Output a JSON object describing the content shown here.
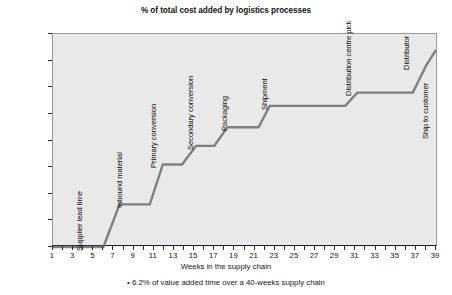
{
  "chart_data": {
    "type": "line",
    "title": "% of total cost added by logistics processes",
    "xlabel": "Weeks in the supply chain",
    "ylabel": "",
    "xlim": [
      1,
      39
    ],
    "ylim": [
      0,
      80
    ],
    "grid": false,
    "legend": "none",
    "caption": "• 6.2% of value added time over a 40-weeks supply chain",
    "y_ticks": [
      "0%",
      "10%",
      "20%",
      "30%",
      "40%",
      "50%",
      "60%",
      "70%",
      "80%"
    ],
    "y_tick_values": [
      0,
      10,
      20,
      30,
      40,
      50,
      60,
      70,
      80
    ],
    "x_ticks": [
      1,
      2,
      3,
      4,
      5,
      6,
      7,
      8,
      9,
      10,
      11,
      12,
      13,
      14,
      15,
      16,
      17,
      18,
      19,
      20,
      21,
      22,
      23,
      24,
      25,
      26,
      27,
      28,
      29,
      30,
      31,
      32,
      33,
      34,
      35,
      36,
      37,
      38,
      39,
      40
    ],
    "x_tick_labels": [
      1,
      3,
      5,
      7,
      9,
      11,
      13,
      15,
      17,
      19,
      21,
      23,
      25,
      27,
      29,
      31,
      33,
      35,
      37,
      39
    ],
    "series": [
      {
        "name": "Cumulative % of total cost added",
        "x": [
          1,
          6,
          7.6,
          10.6,
          11.9,
          13.8,
          15.2,
          17.0,
          18.3,
          21.4,
          22.5,
          30.0,
          31.2,
          36.7,
          38.0,
          39.0
        ],
        "values": [
          0,
          0,
          16,
          16,
          31,
          31,
          38,
          38,
          45,
          45,
          53,
          53,
          58,
          58,
          68,
          74
        ]
      }
    ],
    "steps": [
      {
        "process": "Supplier lead time",
        "start_week": 1,
        "end_week": 6,
        "level": 0
      },
      {
        "process": "Inbound material",
        "start_week": 7.6,
        "end_week": 10.6,
        "level": 16
      },
      {
        "process": "Primary conversion",
        "start_week": 11.9,
        "end_week": 13.8,
        "level": 31
      },
      {
        "process": "Secondary conversion",
        "start_week": 15.2,
        "end_week": 17.0,
        "level": 38
      },
      {
        "process": "Packaging",
        "start_week": 18.3,
        "end_week": 21.4,
        "level": 45
      },
      {
        "process": "Shipment",
        "start_week": 22.5,
        "end_week": 30.0,
        "level": 53
      },
      {
        "process": "Distribution centre pick",
        "start_week": 31.2,
        "end_week": 36.7,
        "level": 58
      },
      {
        "process": "Distributor",
        "start_week": 38.0,
        "end_week": 38.4,
        "level": 68
      },
      {
        "process": "Ship to customer",
        "start_week": 39.0,
        "end_week": 39.0,
        "level": 74
      }
    ],
    "process_labels": [
      {
        "label": "Supplier lead time",
        "week": 4.1,
        "base_pct": 2
      },
      {
        "label": "Inbound material",
        "week": 8.0,
        "base_pct": 18
      },
      {
        "label": "Primary conversion",
        "week": 11.4,
        "base_pct": 33
      },
      {
        "label": "Secondary conversion",
        "week": 15.1,
        "base_pct": 40
      },
      {
        "label": "Packaging",
        "week": 18.5,
        "base_pct": 47
      },
      {
        "label": "Shipment",
        "week": 22.4,
        "base_pct": 55
      },
      {
        "label": "Distribution centre pick",
        "week": 30.8,
        "base_pct": 60
      },
      {
        "label": "Distributor",
        "week": 36.5,
        "base_pct": 70
      },
      {
        "label": "Ship to customer",
        "week": 38.4,
        "base_pct": 44
      }
    ],
    "colors": {
      "plot_background": "#e9e9e9",
      "line": "#808080",
      "axis": "#1a1a1a",
      "frame": "#9a9a9a",
      "text": "#151515",
      "page_background": "#ffffff"
    }
  }
}
